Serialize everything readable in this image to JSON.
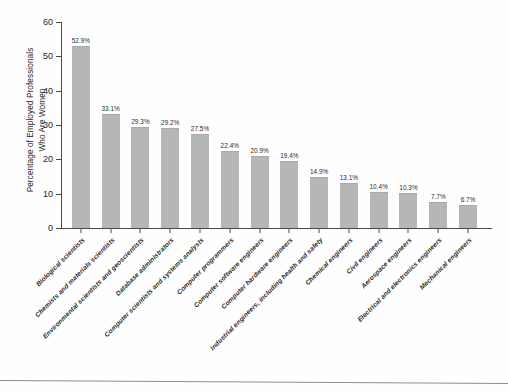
{
  "chart_data": {
    "type": "bar",
    "title": "",
    "xlabel": "",
    "ylabel": "Percentage of Employed Professionals\nWho Are Women",
    "ylim": [
      0,
      60
    ],
    "yticks": [
      0,
      10,
      20,
      30,
      40,
      50,
      60
    ],
    "grid": false,
    "legend": "none",
    "bar_color": "#b6b6b6",
    "axis_color": "#4a4a4a",
    "value_suffix": "%",
    "categories": [
      "Biological scientists",
      "Chemists and materials scientists",
      "Environmental scientists and geoscientists",
      "Database administrators",
      "Computer scientists and systems analysts",
      "Computer programmers",
      "Computer software engineers",
      "Computer hardware engineers",
      "Industrial engineers, including health and safety",
      "Chemical engineers",
      "Civil engineers",
      "Aerospace engineers",
      "Electrical and electronics engineers",
      "Mechanical engineers"
    ],
    "values": [
      52.9,
      33.1,
      29.3,
      29.2,
      27.5,
      22.4,
      20.9,
      19.4,
      14.9,
      13.1,
      10.4,
      10.3,
      7.7,
      6.7
    ],
    "value_labels": [
      "52.9%",
      "33.1%",
      "29.3%",
      "29.2%",
      "27.5%",
      "22.4%",
      "20.9%",
      "19.4%",
      "14.9%",
      "13.1%",
      "10.4%",
      "10.3%",
      "7.7%",
      "6.7%"
    ]
  }
}
